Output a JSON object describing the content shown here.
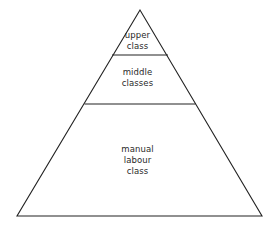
{
  "diagram": {
    "type": "pyramid",
    "stroke_color": "#222222",
    "background": "#ffffff",
    "tiers": [
      {
        "id": "upper",
        "lines": [
          "upper",
          "class"
        ]
      },
      {
        "id": "middle",
        "lines": [
          "middle",
          "classes"
        ]
      },
      {
        "id": "manual",
        "lines": [
          "manual",
          "labour",
          "class"
        ]
      }
    ]
  }
}
